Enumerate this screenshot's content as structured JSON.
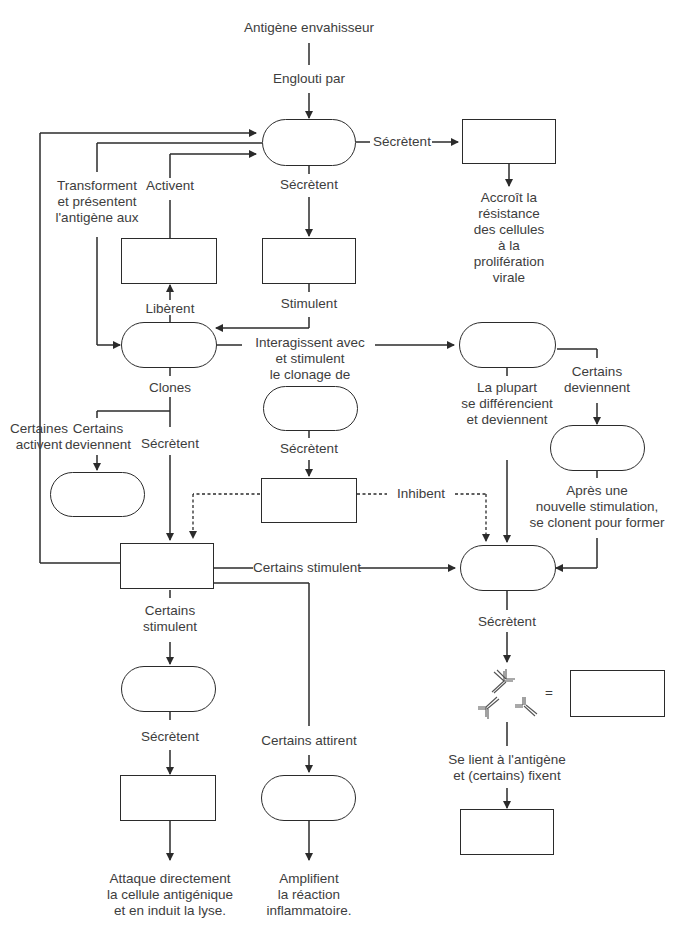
{
  "diagram": {
    "title_top": "Antigène envahisseur",
    "labels": {
      "engloutiPar": "Englouti par",
      "secretentRight": "Sécrètent",
      "secretentDown1": "Sécrètent",
      "accroit": [
        "Accroît la",
        "résistance",
        "des cellules",
        "à la",
        "prolifération",
        "virale"
      ],
      "transforment": [
        "Transforment",
        "et présentent",
        "l'antigène aux"
      ],
      "activent": "Activent",
      "stimulent": "Stimulent",
      "liberent": "Libèrent",
      "interagissent": [
        "Interagissent avec",
        "et stimulent",
        "le clonage de"
      ],
      "clones": "Clones",
      "certainesActivent": [
        "Certaines",
        "activent"
      ],
      "certainsDeviennentLeft": [
        "Certains",
        "deviennent"
      ],
      "secretentMid": "Sécrètent",
      "secretentSupp": "Sécrètent",
      "inhibent": "Inhibent",
      "laPlupart": [
        "La plupart",
        "se différencient",
        "et deviennent"
      ],
      "certainsDeviennentRight": [
        "Certains",
        "deviennent"
      ],
      "apresUne": [
        "Après une",
        "nouvelle stimulation,",
        "se clonent pour former"
      ],
      "certainsStimulentH": "Certains stimulent",
      "certainsStimulentV": [
        "Certains",
        "stimulent"
      ],
      "secretentPlasma": "Sécrètent",
      "secretentCyto": "Sécrètent",
      "certainsAttirent": "Certains attirent",
      "equals": "=",
      "seLient": [
        "Se lient à l'antigène",
        "et (certains) fixent"
      ],
      "attaque": [
        "Attaque directement",
        "la cellule antigénique",
        "et en induit la lyse."
      ],
      "amplifient": [
        "Amplifient",
        "la réaction",
        "inflammatoire."
      ]
    },
    "nodes": {
      "macrophage": {
        "shape": "pill",
        "text": ""
      },
      "interferon": {
        "shape": "rect",
        "text": ""
      },
      "interleukin1": {
        "shape": "rect",
        "text": ""
      },
      "interleukin1b": {
        "shape": "rect",
        "text": ""
      },
      "helperT": {
        "shape": "pill",
        "text": ""
      },
      "bCell": {
        "shape": "pill",
        "text": ""
      },
      "memoryB": {
        "shape": "pill",
        "text": ""
      },
      "suppressorT": {
        "shape": "pill",
        "text": ""
      },
      "suppressorFactor": {
        "shape": "rect",
        "text": ""
      },
      "memoryT": {
        "shape": "pill",
        "text": ""
      },
      "interleukin2": {
        "shape": "rect",
        "text": ""
      },
      "plasmaCell": {
        "shape": "pill",
        "text": ""
      },
      "antibodies": {
        "shape": "rect",
        "text": ""
      },
      "cytotoxicT": {
        "shape": "pill",
        "text": ""
      },
      "lymphotoxin": {
        "shape": "rect",
        "text": ""
      },
      "macrophage2": {
        "shape": "pill",
        "text": ""
      },
      "complement": {
        "shape": "rect",
        "text": ""
      }
    },
    "colors": {
      "line": "#2b2b2b",
      "text": "#3d3d3d",
      "background": "#ffffff"
    }
  }
}
